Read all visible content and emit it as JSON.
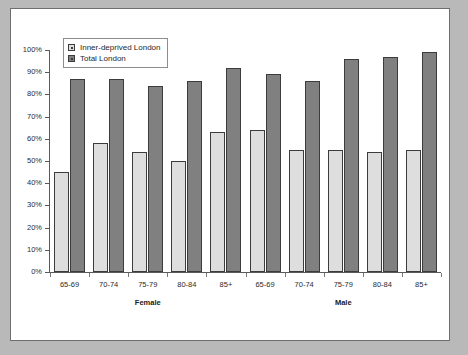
{
  "chart_data": {
    "type": "bar",
    "title": "",
    "subtitle": "",
    "xlabel": "",
    "ylabel": "",
    "ylim": [
      0,
      100
    ],
    "y_ticks": [
      "0%",
      "10%",
      "20%",
      "30%",
      "40%",
      "50%",
      "60%",
      "70%",
      "80%",
      "90%",
      "100%"
    ],
    "y_tick_values": [
      0,
      10,
      20,
      30,
      40,
      50,
      60,
      70,
      80,
      90,
      100
    ],
    "grid": false,
    "legend_position": "top-left",
    "categories": [
      "65-69",
      "70-74",
      "75-79",
      "80-84",
      "85+",
      "65-69",
      "70-74",
      "75-79",
      "80-84",
      "85+"
    ],
    "group_labels": [
      "Female",
      "Male"
    ],
    "series": [
      {
        "name": "Inner-deprived London",
        "color": "#dedede",
        "values": [
          45,
          58,
          54,
          50,
          63,
          64,
          55,
          55,
          54,
          55
        ]
      },
      {
        "name": "Total London",
        "color": "#808080",
        "values": [
          87,
          87,
          84,
          86,
          92,
          89,
          86,
          96,
          97,
          99
        ]
      }
    ]
  },
  "legend": {
    "items": [
      {
        "label": "Inner-deprived London",
        "swatch": "light"
      },
      {
        "label": "Total London",
        "swatch": "dark"
      }
    ]
  },
  "colors": {
    "background": "#b9b9b9",
    "canvas": "#ffffff",
    "frame": "#6e6e6e",
    "axis": "#5a5a5a",
    "series_light": "#dedede",
    "series_dark": "#808080",
    "bar_outline": "#3c3c3c",
    "text": "#2b2b2b"
  }
}
